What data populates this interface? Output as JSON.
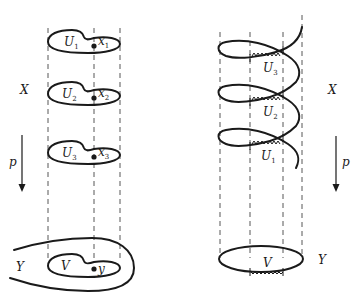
{
  "figure": {
    "left_panel": {
      "space_label_top": "X",
      "map_label": "p",
      "space_label_bottom": "Y",
      "sheets": [
        {
          "open_set": "U",
          "open_set_sub": "1",
          "point": "x",
          "point_sub": "1"
        },
        {
          "open_set": "U",
          "open_set_sub": "2",
          "point": "x",
          "point_sub": "2"
        },
        {
          "open_set": "U",
          "open_set_sub": "3",
          "point": "x",
          "point_sub": "3"
        }
      ],
      "base_set": "V",
      "base_point": "y"
    },
    "right_panel": {
      "space_label_top": "X",
      "map_label": "p",
      "space_label_bottom": "Y",
      "helix_sets": [
        {
          "open_set": "U",
          "open_set_sub": "3"
        },
        {
          "open_set": "U",
          "open_set_sub": "2"
        },
        {
          "open_set": "U",
          "open_set_sub": "1"
        }
      ],
      "base_set": "V"
    }
  }
}
